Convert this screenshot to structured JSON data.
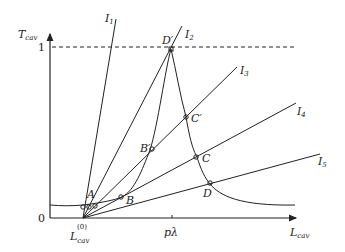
{
  "axes": {
    "y_label": "T",
    "y_label_sub": "cav",
    "x_label": "L",
    "x_label_sub": "cav",
    "y_tick_one": "1",
    "origin": "0",
    "x_tick_start": "L",
    "x_tick_start_sub": "cav",
    "x_tick_start_sup": "(0)",
    "x_tick_mid": "pλ"
  },
  "lines": [
    {
      "id": "I1",
      "label": "I",
      "sub": "1"
    },
    {
      "id": "I2",
      "label": "I",
      "sub": "2"
    },
    {
      "id": "I3",
      "label": "I",
      "sub": "3"
    },
    {
      "id": "I4",
      "label": "I",
      "sub": "4"
    },
    {
      "id": "I5",
      "label": "I",
      "sub": "5"
    }
  ],
  "points": {
    "A": "A",
    "B": "B",
    "Bp": "B′",
    "C": "C",
    "Cp": "C′",
    "D": "D",
    "Dp": "D′"
  },
  "colors": {
    "stroke": "#222222",
    "background": "#ffffff"
  }
}
